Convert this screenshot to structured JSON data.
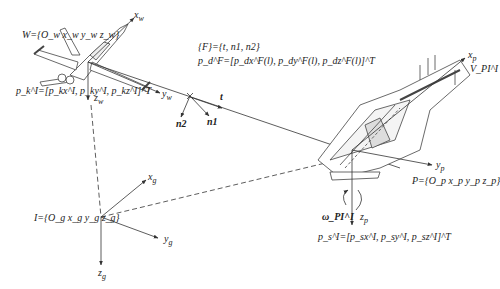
{
  "frames": {
    "world": {
      "label": "W={O_w x_w y_w z_w}",
      "axes": {
        "x": "x_w",
        "y": "y_w",
        "z": "z_w"
      }
    },
    "inertial": {
      "label": "I={O_g x_g y_g z_g}",
      "axes": {
        "x": "x_g",
        "y": "y_g",
        "z": "z_g"
      }
    },
    "platform": {
      "label": "P={O_p x_p y_p z_p}",
      "axes": {
        "x": "x_p",
        "y": "y_p",
        "z": "z_p"
      }
    },
    "frenet": {
      "label": "{F}={t, n1, n2}",
      "vectors": {
        "tangent": "t",
        "normal1": "n1",
        "normal2": "n2"
      }
    }
  },
  "equations": {
    "aircraft_position": "p_k^I=[p_kx^I, p_ky^I, p_kz^I]^T",
    "path_position": "p_d^F=[p_dx^F(l), p_dy^F(l), p_dz^F(l)]^T",
    "platform_position": "p_s^I=[p_sx^I, p_sy^I, p_sz^I]^T",
    "angular_velocity": "ω_PI^I",
    "velocity": "V_PI^I"
  },
  "labels": {
    "W": "W={O",
    "W_sub_w1": "w",
    "W_x": "x",
    "W_y": "y",
    "W_z": "z",
    "close": "}",
    "xw": "x",
    "yw": "y",
    "zw": "z",
    "sub_w": "w",
    "pk": "p",
    "pk_eq": "=[ p",
    "pk_comma": ", p",
    "pk_end": "]",
    "T": "T",
    "F_line": "{F}={",
    "F_t": "t",
    "F_n1": "n",
    "F_n2": "n",
    "sub_1": "1",
    "sub_2": "2",
    "pd_line": "=[ p",
    "pd_l": "(l), p",
    "pd_l_end": "(l)]",
    "t_vec": "t",
    "n1_vec": "n",
    "n2_vec": "n",
    "I_frame": "I={O",
    "xg": "x",
    "yg": "y",
    "zg": "z",
    "sub_g": "g",
    "P_frame": "P={O",
    "xp": "x",
    "yp": "y",
    "zp": "z",
    "sub_p": "p",
    "omega": "ω",
    "V": "V",
    "sub_PI": "PI",
    "sup_I": "I",
    "sup_F": "F",
    "ps": "p",
    "sub_s": "s",
    "sub_k": "k",
    "sub_d": "d"
  },
  "colors": {
    "line": "#333333",
    "background": "#ffffff"
  }
}
